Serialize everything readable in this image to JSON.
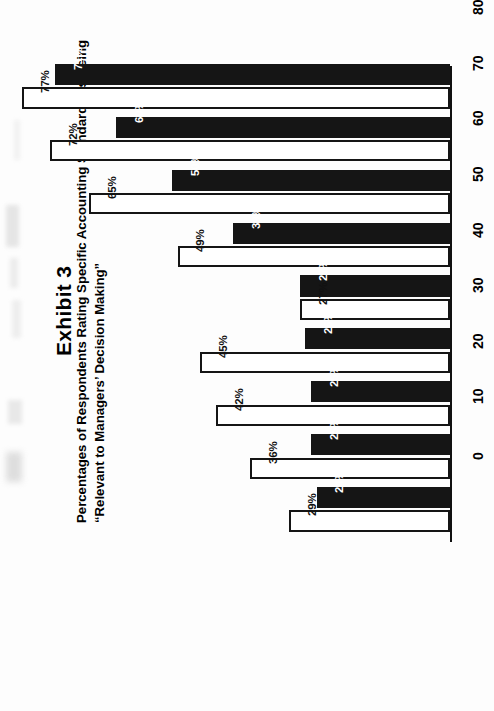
{
  "exhibit": {
    "number_label": "Exhibit 3",
    "subtitle_line1": "Percentages of Respondents Rating Specific Accounting Standards as Being",
    "subtitle_line2": "“Relevant to Managers’ Decision Making”"
  },
  "axis": {
    "value_axis_caption": "Percent",
    "ticks": [
      "0",
      "10",
      "20",
      "30",
      "40",
      "50",
      "60",
      "70",
      "80"
    ]
  },
  "colors": {
    "series_dark": "#151515",
    "series_light": "#ffffff",
    "axis": "#111111",
    "page_background": "#ffffff"
  },
  "chart_data": {
    "type": "bar",
    "title": "Percentages of Respondents Rating Specific Accounting Standards as Being “Relevant to Managers’ Decision Making”",
    "orientation": "horizontal",
    "xlabel": "Percent",
    "ylabel": "",
    "xlim": [
      0,
      80
    ],
    "xticks": [
      0,
      10,
      20,
      30,
      40,
      50,
      60,
      70,
      80
    ],
    "grid": false,
    "legend": "none",
    "categories": [
      "Inventory—Lower of Cost or Market",
      "Statement of Changes",
      "Contingencies",
      "Pensions",
      "Interest Capitalization",
      "Deferred Income Taxes",
      "Discounting Receivables and Payables",
      "Leases",
      "Compensated Absences"
    ],
    "series": [
      {
        "name": "series-dark",
        "style": "filled-black",
        "values": [
          71,
          60,
          50,
          39,
          27,
          26,
          25,
          25,
          24
        ],
        "labels": [
          "71%",
          "60%",
          "50%",
          "39%",
          "27%",
          "26%",
          "25%",
          "25%",
          "24%"
        ]
      },
      {
        "name": "series-light",
        "style": "outline-white",
        "values": [
          77,
          72,
          65,
          49,
          27,
          45,
          42,
          36,
          29
        ],
        "labels": [
          "77%",
          "72%",
          "65%",
          "49%",
          "27%",
          "45%",
          "42%",
          "36%",
          "29%"
        ]
      }
    ]
  },
  "category_labels": [
    {
      "line1": "Inventory—Lower",
      "line2": "of Cost or Market"
    },
    {
      "line1": "Statement",
      "line2": "of Changes"
    },
    {
      "line1": "Contingencies",
      "line2": ""
    },
    {
      "line1": "Pensions",
      "line2": ""
    },
    {
      "line1": "Interest",
      "line2": "Capitalization"
    },
    {
      "line1": "Deferred",
      "line2": "Income Taxes"
    },
    {
      "line1": "Discounting",
      "line2": "Receivables and",
      "line3": "Payables"
    },
    {
      "line1": "Leases",
      "line2": ""
    },
    {
      "line1": "Compensated",
      "line2": "Absences"
    }
  ]
}
